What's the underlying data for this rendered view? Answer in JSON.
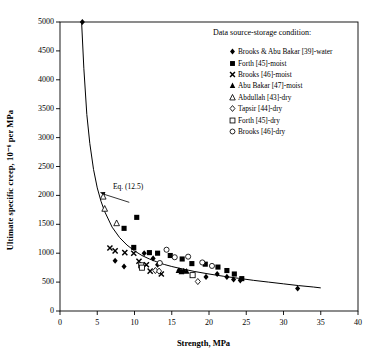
{
  "chart_data": {
    "type": "scatter",
    "title": "",
    "xlabel": "Strength, MPa",
    "ylabel": "Ultimate specific creep, 10⁻⁶ per MPa",
    "xlim": [
      0,
      40
    ],
    "ylim": [
      0,
      5000
    ],
    "xticks": [
      0,
      5,
      10,
      15,
      20,
      25,
      30,
      35,
      40
    ],
    "yticks": [
      0,
      500,
      1000,
      1500,
      2000,
      2500,
      3000,
      3500,
      4000,
      4500,
      5000
    ],
    "grid": false,
    "legend_position": "upper-right",
    "legend_title": "Data source-storage condition:",
    "annotations": [
      {
        "text": "Eq. (12.5)",
        "x": 9.6,
        "y": 1830,
        "points_to_x": 5.4,
        "points_to_y": 1960
      }
    ],
    "fit_curve": {
      "label": "Eq. (12.5)",
      "form": "hyperbolic decay",
      "x": [
        2.9,
        3.2,
        3.6,
        4.0,
        4.5,
        5.0,
        5.5,
        6.0,
        7.0,
        8.0,
        9.0,
        10.0,
        11.0,
        12.0,
        13.0,
        14.0,
        15.0,
        16.0,
        18.0,
        20.0,
        22.0,
        24.0,
        26.0,
        28.0,
        30.0,
        32.0,
        34.0,
        35.0
      ],
      "y": [
        5000,
        4200,
        3400,
        2900,
        2450,
        2130,
        1900,
        1720,
        1450,
        1270,
        1140,
        1040,
        960,
        900,
        850,
        805,
        770,
        740,
        685,
        640,
        600,
        565,
        530,
        500,
        470,
        440,
        415,
        400
      ]
    },
    "series": [
      {
        "name": "Brooks & Abu Bakar [39]-water",
        "marker": "filled-diamond",
        "points": [
          [
            3.0,
            5000
          ],
          [
            7.4,
            870
          ],
          [
            8.6,
            770
          ],
          [
            11.3,
            1000
          ],
          [
            12.5,
            910
          ],
          [
            13.1,
            800
          ],
          [
            16.0,
            700
          ],
          [
            16.6,
            690
          ],
          [
            19.6,
            590
          ],
          [
            21.1,
            640
          ],
          [
            22.4,
            590
          ],
          [
            23.3,
            545
          ],
          [
            24.2,
            530
          ],
          [
            31.9,
            390
          ]
        ]
      },
      {
        "name": "Forth [45]-moist",
        "marker": "filled-square",
        "points": [
          [
            8.6,
            1430
          ],
          [
            9.9,
            1100
          ],
          [
            10.3,
            1620
          ],
          [
            12.0,
            1010
          ],
          [
            13.1,
            1000
          ],
          [
            14.8,
            960
          ],
          [
            16.4,
            900
          ],
          [
            17.7,
            820
          ],
          [
            19.5,
            810
          ],
          [
            21.2,
            760
          ],
          [
            22.4,
            700
          ],
          [
            23.4,
            640
          ],
          [
            24.4,
            560
          ]
        ]
      },
      {
        "name": "Brooks [46]-moist",
        "marker": "x",
        "points": [
          [
            6.7,
            1090
          ],
          [
            7.4,
            1040
          ],
          [
            8.7,
            1010
          ],
          [
            9.9,
            1000
          ],
          [
            10.6,
            860
          ],
          [
            11.6,
            800
          ],
          [
            12.1,
            690
          ],
          [
            13.6,
            640
          ]
        ]
      },
      {
        "name": "Abu Bakar [47]-moist",
        "marker": "filled-triangle",
        "points": [
          [
            15.9,
            700
          ],
          [
            16.3,
            680
          ],
          [
            17.0,
            690
          ]
        ]
      },
      {
        "name": "Abdullah [43]-dry",
        "marker": "open-triangle",
        "points": [
          [
            5.8,
            1980
          ],
          [
            6.0,
            1770
          ],
          [
            7.6,
            1520
          ]
        ]
      },
      {
        "name": "Tapsir [44]-dry",
        "marker": "open-diamond",
        "points": [
          [
            12.8,
            700
          ],
          [
            13.3,
            690
          ],
          [
            18.5,
            510
          ]
        ]
      },
      {
        "name": "Forth [45]-dry",
        "marker": "open-square",
        "points": [
          [
            10.9,
            790
          ],
          [
            11.0,
            750
          ],
          [
            17.8,
            620
          ]
        ]
      },
      {
        "name": "Brooks [46]-dry",
        "marker": "open-circle",
        "points": [
          [
            13.4,
            830
          ],
          [
            14.3,
            1060
          ],
          [
            15.4,
            930
          ],
          [
            17.2,
            940
          ],
          [
            19.1,
            840
          ],
          [
            20.4,
            780
          ]
        ]
      }
    ]
  }
}
